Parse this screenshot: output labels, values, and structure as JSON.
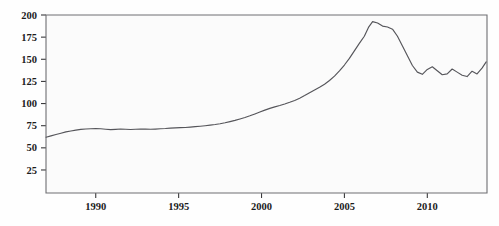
{
  "chart_data": {
    "type": "line",
    "title": "",
    "subtitle": "",
    "xlabel": "",
    "ylabel": "",
    "xlim": [
      1987.0,
      2013.6
    ],
    "ylim": [
      -1,
      200
    ],
    "grid": false,
    "legend": false,
    "legend_position": "none",
    "xticks": [
      1990,
      1995,
      2000,
      2005,
      2010
    ],
    "xtick_labels": [
      "1990",
      "1995",
      "2000",
      "2005",
      "2010"
    ],
    "yticks": [
      25,
      50,
      75,
      100,
      125,
      150,
      175,
      200
    ],
    "ytick_labels": [
      "25",
      "50",
      "75",
      "100",
      "125",
      "150",
      "175",
      "200"
    ],
    "line_color": "#55555a",
    "plot_background": "#fbfbfb",
    "axis_color": "#6e6e72",
    "series": [
      {
        "name": "index",
        "x": [
          1987.0,
          1987.3,
          1987.6,
          1987.9,
          1988.2,
          1988.5,
          1988.8,
          1989.1,
          1989.4,
          1989.7,
          1990.0,
          1990.3,
          1990.6,
          1990.9,
          1991.2,
          1991.5,
          1991.8,
          1992.1,
          1992.4,
          1992.7,
          1993.0,
          1993.3,
          1993.6,
          1993.9,
          1994.2,
          1994.5,
          1994.8,
          1995.1,
          1995.4,
          1995.7,
          1996.0,
          1996.3,
          1996.6,
          1996.9,
          1997.2,
          1997.5,
          1997.8,
          1998.1,
          1998.4,
          1998.7,
          1999.0,
          1999.3,
          1999.6,
          1999.9,
          2000.2,
          2000.5,
          2000.8,
          2001.1,
          2001.4,
          2001.7,
          2002.0,
          2002.3,
          2002.6,
          2002.9,
          2003.2,
          2003.5,
          2003.8,
          2004.1,
          2004.4,
          2004.7,
          2005.0,
          2005.3,
          2005.6,
          2005.9,
          2006.2,
          2006.45,
          2006.7,
          2007.0,
          2007.3,
          2007.6,
          2007.9,
          2008.2,
          2008.5,
          2008.8,
          2009.1,
          2009.4,
          2009.7,
          2010.0,
          2010.3,
          2010.6,
          2010.9,
          2011.2,
          2011.5,
          2011.8,
          2012.1,
          2012.4,
          2012.7,
          2013.0,
          2013.3,
          2013.55
        ],
        "y": [
          62,
          63.5,
          65,
          66.5,
          68,
          69,
          70,
          70.8,
          71.3,
          71.6,
          71.8,
          71.5,
          71.0,
          70.6,
          70.9,
          71.3,
          71.0,
          70.7,
          71.0,
          71.3,
          71.2,
          71.0,
          71.2,
          71.5,
          71.8,
          72.3,
          72.6,
          72.8,
          73.0,
          73.4,
          73.9,
          74.4,
          75.0,
          75.6,
          76.3,
          77.2,
          78.3,
          79.6,
          81.0,
          82.6,
          84.3,
          86.2,
          88.3,
          90.4,
          92.6,
          94.6,
          96.3,
          97.8,
          99.5,
          101.4,
          103.5,
          106.0,
          109.0,
          112.2,
          115.3,
          118.4,
          121.8,
          126.0,
          131.0,
          137.0,
          143.5,
          151.0,
          159.5,
          168.0,
          176.0,
          186.0,
          192.5,
          191.0,
          187.5,
          186.5,
          184.0,
          176.0,
          165.0,
          154.0,
          143.0,
          135.5,
          133.0,
          138.5,
          141.5,
          137.0,
          132.5,
          133.5,
          139.0,
          135.5,
          132.0,
          130.5,
          136.5,
          133.5,
          140.0,
          147.0
        ]
      }
    ]
  },
  "axes": {
    "y_tick_name_prefix": "y-axis-tick",
    "x_tick_name_prefix": "x-axis-tick"
  }
}
